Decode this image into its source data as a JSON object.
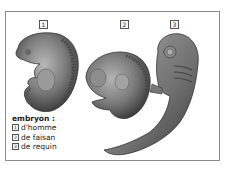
{
  "figure": {
    "labels": [
      {
        "number": "1",
        "x": 39,
        "y": 20
      },
      {
        "number": "2",
        "x": 120,
        "y": 20
      },
      {
        "number": "3",
        "x": 170,
        "y": 20
      }
    ],
    "legend": {
      "title": "embryon :",
      "items": [
        {
          "number": "1",
          "label": "d'homme"
        },
        {
          "number": "2",
          "label": "de faisan"
        },
        {
          "number": "3",
          "label": "de requin"
        }
      ]
    }
  }
}
